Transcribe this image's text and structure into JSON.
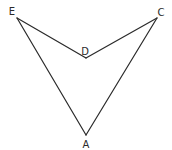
{
  "diagram": {
    "type": "concave-quadrilateral",
    "vertices": [
      {
        "id": "E",
        "label": "E",
        "x": 17,
        "y": 18,
        "lx": 12,
        "ly": 15
      },
      {
        "id": "C",
        "label": "C",
        "x": 157,
        "y": 18,
        "lx": 161,
        "ly": 16
      },
      {
        "id": "D",
        "label": "D",
        "x": 86,
        "y": 58,
        "lx": 85,
        "ly": 55
      },
      {
        "id": "A",
        "label": "A",
        "x": 86,
        "y": 135,
        "lx": 86,
        "ly": 148
      }
    ],
    "edges": [
      [
        "E",
        "D"
      ],
      [
        "D",
        "C"
      ],
      [
        "C",
        "A"
      ],
      [
        "A",
        "E"
      ]
    ],
    "colors": {
      "stroke": "#2a2a2a",
      "background": "#ffffff"
    }
  }
}
